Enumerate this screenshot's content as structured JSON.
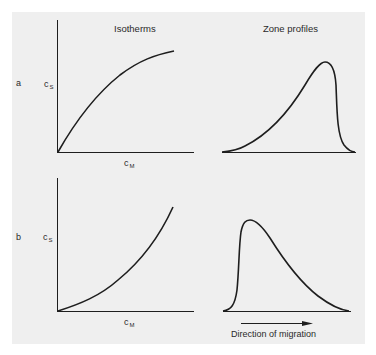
{
  "headers": {
    "isotherms": "Isotherms",
    "zone_profiles": "Zone profiles"
  },
  "rows": [
    {
      "label": "a",
      "y_axis": {
        "var": "c",
        "sub": "S"
      },
      "x_axis": {
        "var": "c",
        "sub": "M"
      },
      "isotherm_shape": "convex (Langmuir-type, concave down)",
      "zone_profile_shape": "sharp front, diffuse rear (tailing toward start)"
    },
    {
      "label": "b",
      "y_axis": {
        "var": "c",
        "sub": "S"
      },
      "x_axis": {
        "var": "c",
        "sub": "M"
      },
      "isotherm_shape": "concave (anti-Langmuir, concave up)",
      "zone_profile_shape": "diffuse front, sharp rear (fronting)"
    }
  ],
  "footer": {
    "arrow_label": "Direction of migration"
  },
  "colors": {
    "panel_bg": "#efefef",
    "line": "#1e1e1e"
  }
}
